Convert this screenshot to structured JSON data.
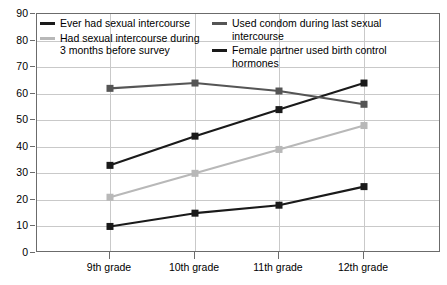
{
  "chart_data": {
    "type": "line",
    "title": "",
    "subtitle": "",
    "xlabel": "",
    "ylabel": "",
    "categories": [
      "9th grade",
      "10th grade",
      "11th grade",
      "12th grade"
    ],
    "ylim": [
      0,
      90
    ],
    "ytick_step": 10,
    "yticks": [
      90,
      80,
      70,
      60,
      50,
      40,
      30,
      20,
      10,
      0
    ],
    "grid": true,
    "legend_position": "top-inside",
    "series": [
      {
        "name": "Ever had sexual intercourse",
        "color": "#1a1a1a",
        "values": [
          33,
          44,
          54,
          64
        ]
      },
      {
        "name": "Used condom during last sexual intercourse",
        "color": "#555555",
        "values": [
          62,
          64,
          61,
          56
        ]
      },
      {
        "name": "Had sexual intercourse during\n3 months before survey",
        "color": "#b8b8b8",
        "values": [
          21,
          30,
          39,
          48
        ]
      },
      {
        "name": "Female partner used birth control hormones",
        "color": "#1a1a1a",
        "values": [
          10,
          15,
          18,
          25
        ]
      }
    ]
  },
  "legend": {
    "left_column": [
      {
        "label": "Ever had sexual intercourse",
        "color": "#1a1a1a"
      },
      {
        "label": "Had sexual intercourse during\n3 months before survey",
        "color": "#b8b8b8"
      }
    ],
    "right_column": [
      {
        "label": "Used condom during last sexual intercourse",
        "color": "#555555"
      },
      {
        "label": "Female partner used birth control hormones",
        "color": "#1a1a1a"
      }
    ]
  },
  "axis": {
    "y_tick_labels": [
      "90",
      "80",
      "70",
      "60",
      "50",
      "40",
      "30",
      "20",
      "10",
      "0"
    ],
    "x_tick_labels": [
      "9th grade",
      "10th grade",
      "11th grade",
      "12th grade"
    ]
  },
  "colors": {
    "grid": "#c9c9c9",
    "frame": "#6b6b6b",
    "background": "#ffffff",
    "series_black": "#1a1a1a",
    "series_dark_gray": "#555555",
    "series_light_gray": "#b8b8b8"
  }
}
